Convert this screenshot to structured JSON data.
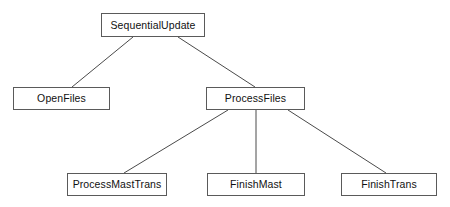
{
  "diagram": {
    "type": "tree",
    "background_color": "#ffffff",
    "box_border_color": "#5a5a5a",
    "box_fill_color": "#ffffff",
    "text_color": "#111111",
    "edge_color": "#4a4a4a",
    "nodes": [
      {
        "id": "sequential-update",
        "label": "SequentialUpdate",
        "level": 0,
        "x": 101,
        "y": 13,
        "width": 104,
        "height": 24
      },
      {
        "id": "open-files",
        "label": "OpenFiles",
        "level": 1,
        "x": 13,
        "y": 87,
        "width": 97,
        "height": 23
      },
      {
        "id": "process-files",
        "label": "ProcessFiles",
        "level": 1,
        "x": 206,
        "y": 87,
        "width": 99,
        "height": 23
      },
      {
        "id": "process-mast-trans",
        "label": "ProcessMastTrans",
        "level": 2,
        "x": 67,
        "y": 173,
        "width": 100,
        "height": 23
      },
      {
        "id": "finish-mast",
        "label": "FinishMast",
        "level": 2,
        "x": 207,
        "y": 173,
        "width": 98,
        "height": 23
      },
      {
        "id": "finish-trans",
        "label": "FinishTrans",
        "level": 2,
        "x": 341,
        "y": 173,
        "width": 96,
        "height": 23
      }
    ],
    "edges": [
      {
        "id": "edge-sequentialupdate-openfiles",
        "from": "sequential-update",
        "to": "open-files",
        "x1": 133,
        "y1": 37,
        "x2": 72,
        "y2": 87
      },
      {
        "id": "edge-sequentialupdate-processfiles",
        "from": "sequential-update",
        "to": "process-files",
        "x1": 178,
        "y1": 37,
        "x2": 255,
        "y2": 87
      },
      {
        "id": "edge-processfiles-processmasttrans",
        "from": "process-files",
        "to": "process-mast-trans",
        "x1": 228,
        "y1": 110,
        "x2": 124,
        "y2": 173
      },
      {
        "id": "edge-processfiles-finishmast",
        "from": "process-files",
        "to": "finish-mast",
        "x1": 256,
        "y1": 110,
        "x2": 256,
        "y2": 173
      },
      {
        "id": "edge-processfiles-finishtrans",
        "from": "process-files",
        "to": "finish-trans",
        "x1": 288,
        "y1": 110,
        "x2": 386,
        "y2": 173
      }
    ]
  }
}
